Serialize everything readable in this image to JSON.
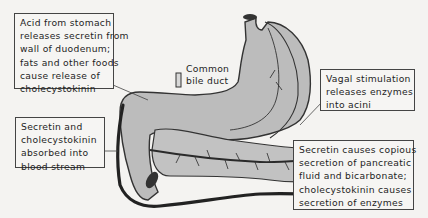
{
  "figure": {
    "colors": {
      "organ_fill": "#bcbcbc",
      "outline": "#333333",
      "vessel": "#2a2a2a",
      "background": "#f4f3f1"
    }
  },
  "annotations": {
    "acid_box": {
      "lines": [
        "Acid from stomach",
        "releases secretin from",
        "wall of duodenum;",
        "fats and other foods",
        "cause release of",
        "cholecystokinin"
      ]
    },
    "blood_box": {
      "lines": [
        "Secretin and",
        "cholecystokinin",
        "absorbed into",
        "blood stream"
      ]
    },
    "vagal_box": {
      "lines": [
        "Vagal stimulation",
        "releases enzymes",
        "into acini"
      ]
    },
    "secretion_box": {
      "lines": [
        "Secretin causes copious",
        "secretion of pancreatic",
        "fluid and bicarbonate;",
        "cholecystokinin causes",
        "secretion of enzymes"
      ]
    },
    "bile_duct_label": {
      "lines": [
        "Common",
        "bile duct"
      ]
    }
  }
}
